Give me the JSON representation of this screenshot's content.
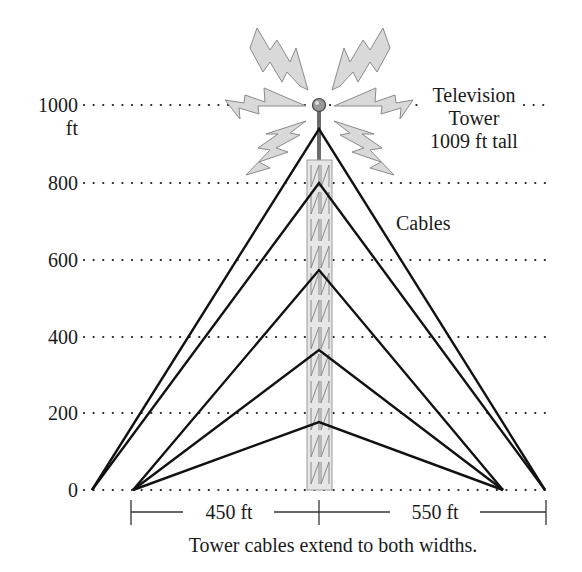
{
  "diagram": {
    "type": "tower-cable-diagram",
    "y_axis": {
      "unit_label": "ft",
      "ticks": [
        "0",
        "200",
        "400",
        "600",
        "800",
        "1000"
      ]
    },
    "labels": {
      "tower_line1": "Television",
      "tower_line2": "Tower",
      "tower_line3": "1009 ft tall",
      "cables": "Cables"
    },
    "dimensions": {
      "left_width": "450 ft",
      "right_width": "550 ft"
    },
    "caption": "Tower cables extend to both widths.",
    "colors": {
      "cable": "#111111",
      "signal_bolt_fill": "#d9d9d9",
      "tower_fill": "#e6e6e6",
      "background": "#ffffff"
    }
  }
}
